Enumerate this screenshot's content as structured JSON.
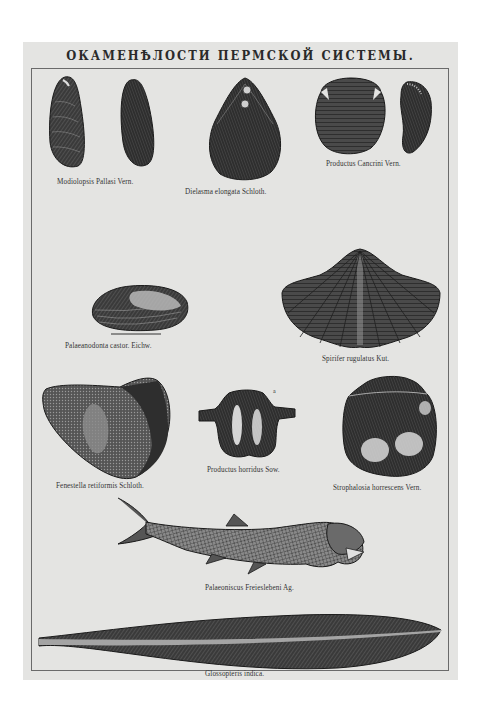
{
  "plate": {
    "title": "ОКАМЕНѢЛОСТИ ПЕРМСКОЙ СИСТЕМЫ.",
    "background_color": "#e4e4e2",
    "ink_color": "#2a2a2a"
  },
  "specimens": [
    {
      "id": "modiolopsis",
      "label": "Modiolopsis Pallasi Vern."
    },
    {
      "id": "dielasma",
      "label": "Dielasma elongata Schloth."
    },
    {
      "id": "productus-cancrini",
      "label": "Productus Cancrini Vern."
    },
    {
      "id": "palaeanodonta",
      "label": "Palaeanodonta castor. Eichw."
    },
    {
      "id": "spirifer",
      "label": "Spirifer rugulatus Kut."
    },
    {
      "id": "fenestella",
      "label": "Fenestella retiformis Schloth."
    },
    {
      "id": "productus-horridus",
      "label": "Productus horridus Sow.",
      "marker": "a"
    },
    {
      "id": "strophalosia",
      "label": "Strophalosia horrescens Vern."
    },
    {
      "id": "palaeoniscus",
      "label": "Palaeoniscus Freieslebeni Ag."
    },
    {
      "id": "glossopteris",
      "label": "Glossopteris indica."
    }
  ]
}
